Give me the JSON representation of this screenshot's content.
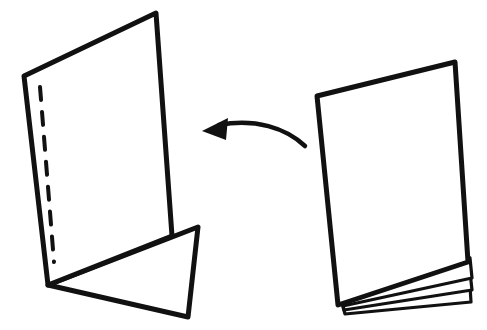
{
  "figure": {
    "type": "line-illustration",
    "background_color": "#ffffff",
    "ink_color": "#111111",
    "canvas": {
      "width": 487,
      "height": 330
    }
  },
  "right_object": {
    "name": "page-stack",
    "label": "Stack of sheets",
    "sheet_count": 4,
    "front_page": {
      "points": "317,96 455,62 468,262 338,305",
      "stroke_width": 5
    },
    "under_sheets": [
      {
        "points": "341,292 470,258 472,278 343,306",
        "stroke_width": 3.2
      },
      {
        "points": "342,300 470,272 472,290 344,310",
        "stroke_width": 3.2
      },
      {
        "points": "343,307 470,286 471,302 345,314",
        "stroke_width": 3.2
      }
    ]
  },
  "arrow": {
    "name": "curved-left-arrow",
    "label": "Fold direction arrow",
    "direction": "left",
    "tail_point": "305,146",
    "head_point": "202,131",
    "path": "M 305,146 C 286,128 255,118 219,125",
    "head_points": "202,131 228,118 226,140",
    "stroke_width": 4.5
  },
  "left_object": {
    "name": "folded-sheet",
    "label": "Single sheet folded back",
    "main_page": {
      "points": "24,76 156,13 172,236 48,285",
      "stroke_width": 5
    },
    "folded_flap": {
      "points": "48,285 198,227 188,317",
      "stroke_width": 5
    },
    "fold_crease": {
      "name": "dashed-fold-line",
      "path": "M 40,87 L 54,262",
      "stroke_width": 4,
      "dash_pattern": "13 12"
    }
  },
  "accessibility": {
    "alt_text": "Hand drawn diagram: a pad of sheets on the right, a curved arrow pointing left, and a single sheet on the left with a dashed fold line and a triangular flap folded under."
  }
}
